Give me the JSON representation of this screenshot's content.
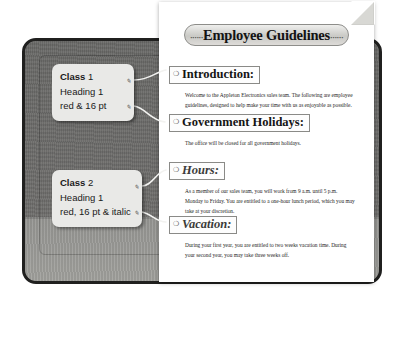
{
  "document": {
    "title": "Employee Guidelines",
    "title_ornament_left": "······",
    "title_ornament_right": "······",
    "section_marker": "❍",
    "sections": [
      {
        "heading": "Introduction:",
        "style": "bold",
        "body": "Welcome to the Appleton Electronics sales team. The following are employee guidelines, designed to help make your time with us as enjoyable as possible."
      },
      {
        "heading": "Government Holidays:",
        "style": "bold",
        "body": "The office will be closed for all government holidays."
      },
      {
        "heading": "Hours:",
        "style": "bold-italic",
        "body": "As a member of our sales team, you will work from 9 a.m. until 5 p.m. Monday to Friday. You are entitled to a one-hour lunch period, which you may take at your discretion."
      },
      {
        "heading": "Vacation:",
        "style": "bold-italic",
        "body": "During your first year, you are entitled to two weeks vacation time. During your second year, you may take three weeks off."
      }
    ]
  },
  "callouts": [
    {
      "name": "class-1",
      "title_bold": "Class",
      "title_rest": " 1",
      "line2": "Heading 1",
      "line3": "red & 16 pt"
    },
    {
      "name": "class-2",
      "title_bold": "Class",
      "title_rest": " 2",
      "line2": "Heading 1",
      "line3": "red, 16 pt & italic"
    }
  ],
  "anchors": {
    "glyph": "✎"
  },
  "colors": {
    "frame_border": "#20201f",
    "surface_dark": "#6f6f6d",
    "surface_light": "#9a9a97",
    "page": "#ffffff",
    "callout_bg": "#e9e9e7",
    "title_banner": "#d3d3cf"
  }
}
